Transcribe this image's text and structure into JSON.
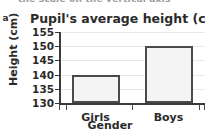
{
  "page": {
    "item_marker": "a",
    "cut_off_header_text": "the scale on the vertical axis"
  },
  "chart_data": {
    "type": "bar",
    "title": "Pupil's average height (cm)",
    "xlabel": "Gender",
    "ylabel": "Height (cm)",
    "categories": [
      "Girls",
      "Boys"
    ],
    "values": [
      140,
      150
    ],
    "ylim": [
      130,
      155
    ],
    "ytick_step": 5,
    "yticks": [
      130,
      135,
      140,
      145,
      150,
      155
    ],
    "grid": true,
    "legend": false,
    "colors": {
      "bar_fill": "#f4f4f4",
      "bar_outline": "#4a4a4a",
      "axis": "#3a3a3a",
      "gridline": "#e8e8e8",
      "text": "#2b2b2b"
    }
  }
}
